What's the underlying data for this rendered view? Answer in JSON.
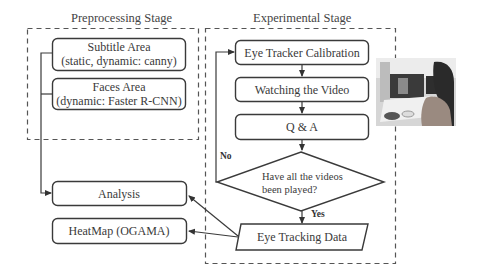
{
  "stages": {
    "preprocessing": {
      "title": "Preprocessing Stage",
      "boxes": [
        {
          "line1": "Subtitle Area",
          "line2": "(static, dynamic: canny)"
        },
        {
          "line1": "Faces Area",
          "line2": "(dynamic: Faster R-CNN)"
        }
      ]
    },
    "experimental": {
      "title": "Experimental Stage",
      "steps": [
        "Eye Tracker Calibration",
        "Watching the Video",
        "Q & A"
      ],
      "decision": {
        "line1": "Have all the videos",
        "line2": "been played?"
      },
      "no_label": "No",
      "yes_label": "Yes",
      "data_node": "Eye Tracking Data"
    }
  },
  "outputs": {
    "analysis": "Analysis",
    "heatmap": "HeatMap (OGAMA)"
  },
  "photo": {
    "description": "participant-at-eye-tracker-photo"
  },
  "colors": {
    "stroke": "#3a3a3a",
    "dash": "#555555",
    "background": "#ffffff"
  }
}
